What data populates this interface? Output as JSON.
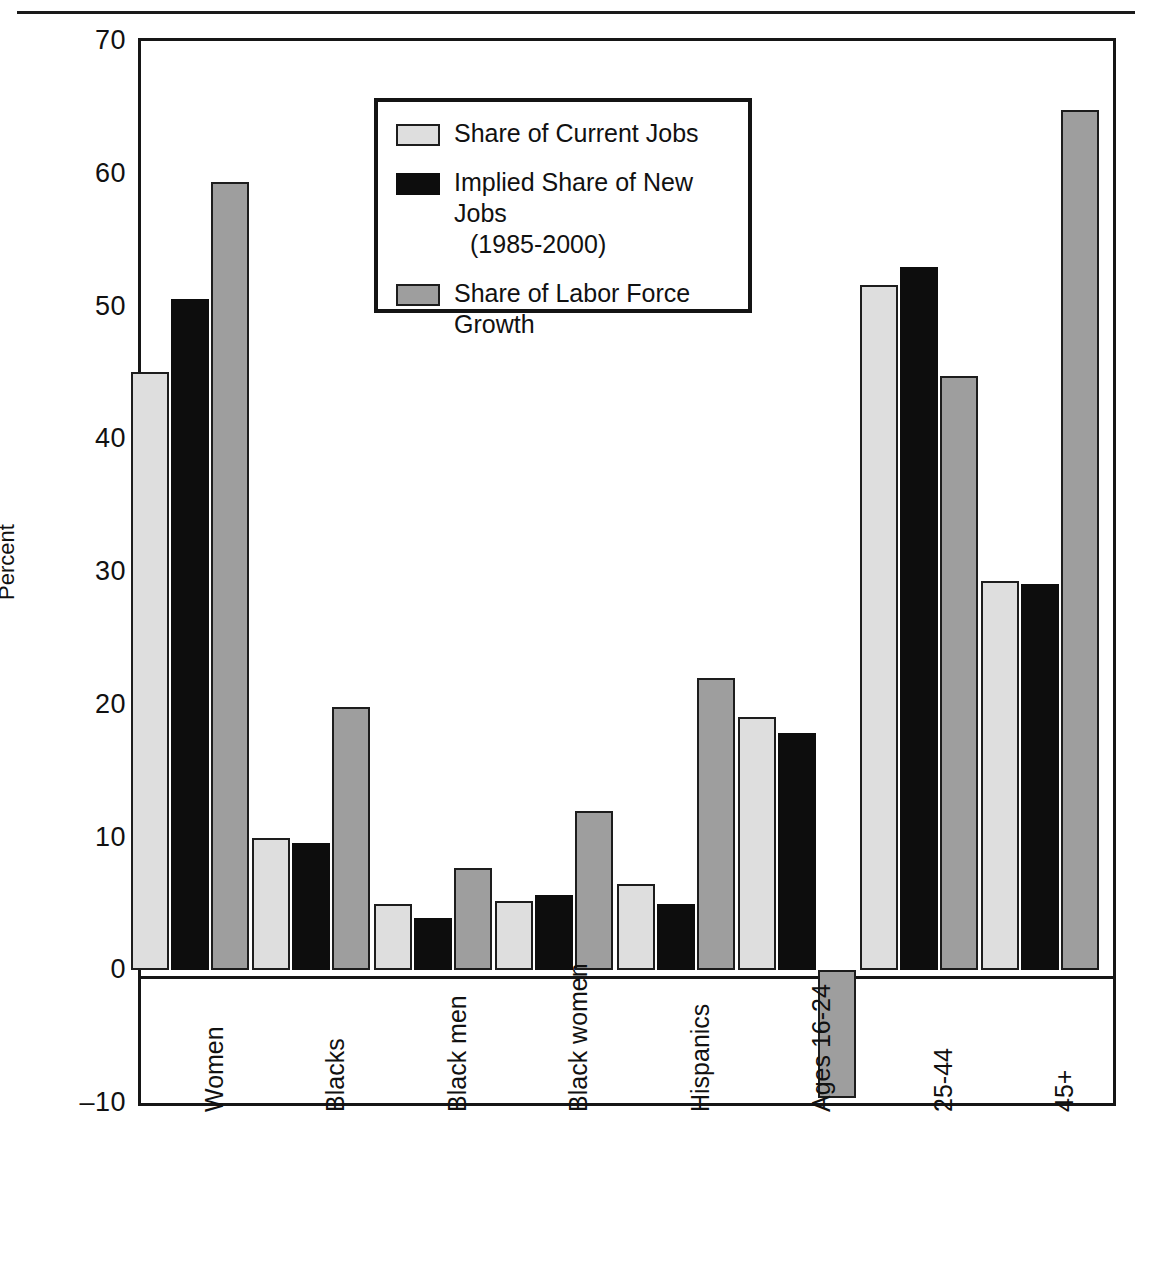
{
  "chart_data": {
    "type": "bar",
    "title": "",
    "xlabel": "",
    "ylabel": "Percent",
    "ylim": [
      -10,
      70
    ],
    "yticks": [
      70,
      60,
      50,
      40,
      30,
      20,
      10,
      0,
      -10
    ],
    "ytick_labels": [
      "70",
      "60",
      "50",
      "40",
      "30",
      "20",
      "10",
      "0",
      "–10"
    ],
    "grid": false,
    "legend_position": "upper-left-inside",
    "categories": [
      "Women",
      "Blacks",
      "Black men",
      "Black women",
      "Hispanics",
      "Ages 16-24",
      "25-44",
      "45+"
    ],
    "series": [
      {
        "name": "Share of Current Jobs",
        "color": "#dedede",
        "values": [
          45.1,
          10.0,
          5.0,
          5.2,
          6.5,
          19.1,
          51.6,
          29.3
        ]
      },
      {
        "name": "Implied Share of New Jobs (1985-2000)",
        "color": "#0d0d0d",
        "values": [
          50.6,
          9.6,
          3.9,
          5.7,
          5.0,
          17.9,
          53.0,
          29.1
        ]
      },
      {
        "name": "Share of Labor Force Growth",
        "color": "#9e9e9e",
        "values": [
          59.4,
          19.8,
          7.7,
          12.0,
          22.0,
          -9.6,
          44.8,
          64.8
        ]
      }
    ]
  },
  "legend": {
    "items": [
      {
        "label": "Share of Current Jobs",
        "sub": "",
        "swatch": "s0"
      },
      {
        "label": "Implied Share of New Jobs",
        "sub": "(1985-2000)",
        "swatch": "s1"
      },
      {
        "label": "Share of Labor Force Growth",
        "sub": "",
        "swatch": "s2"
      }
    ]
  },
  "axis": {
    "y_title": "Percent"
  }
}
